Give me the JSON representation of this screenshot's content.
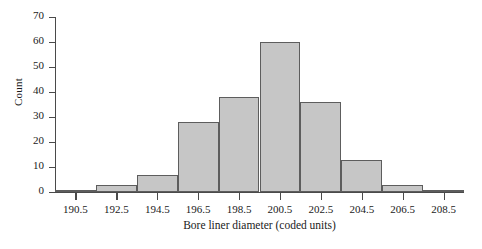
{
  "chart_data": {
    "type": "bar",
    "title": "",
    "xlabel": "Bore liner diameter (coded units)",
    "ylabel": "Count",
    "categories": [
      "190.5",
      "192.5",
      "194.5",
      "196.5",
      "198.5",
      "200.5",
      "202.5",
      "204.5",
      "206.5",
      "208.5"
    ],
    "bin_edges": [
      189.5,
      191.5,
      193.5,
      195.5,
      197.5,
      199.5,
      201.5,
      203.5,
      205.5,
      207.5,
      209.5
    ],
    "values": [
      1,
      3,
      7,
      28,
      38,
      60,
      36,
      13,
      3,
      1
    ],
    "xtick_labels": [
      "190.5",
      "192.5",
      "194.5",
      "196.5",
      "198.5",
      "200.5",
      "202.5",
      "204.5",
      "206.5",
      "208.5"
    ],
    "ytick_labels": [
      "0",
      "10",
      "20",
      "30",
      "40",
      "50",
      "60",
      "70"
    ],
    "ytick_values": [
      0,
      10,
      20,
      30,
      40,
      50,
      60,
      70
    ],
    "ylim": [
      0,
      70
    ],
    "xlim": [
      189.5,
      209.5
    ],
    "grid": false,
    "legend": false,
    "bar_fill_color": "#c6c6c6",
    "bar_edge_color": "#5d5d5d",
    "axis_color": "#4a4a4a",
    "text_color": "#1a1a1a"
  },
  "caption": {
    "remnant": "—"
  }
}
